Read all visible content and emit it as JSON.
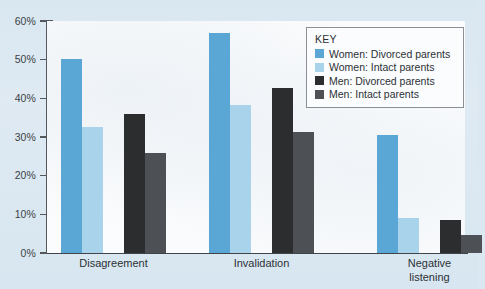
{
  "chart_data": {
    "type": "bar",
    "title": "",
    "xlabel": "",
    "ylabel": "",
    "ylim": [
      0,
      60
    ],
    "grid": false,
    "legend_position": "top-right",
    "y_ticks": [
      "0%",
      "10%",
      "20%",
      "30%",
      "40%",
      "50%",
      "60%"
    ],
    "y_tick_values": [
      0,
      10,
      20,
      30,
      40,
      50,
      60
    ],
    "categories": [
      "Disagreement",
      "Invalidation",
      "Negative\nlistening"
    ],
    "series": [
      {
        "name": "Women: Divorced parents",
        "color": "#5aa7d6",
        "values": [
          50.2,
          56.8,
          30.4
        ]
      },
      {
        "name": "Women: Intact parents",
        "color": "#a8d3ea",
        "values": [
          32.7,
          38.2,
          9.0
        ]
      },
      {
        "name": "Men: Divorced parents",
        "color": "#2c2d2f",
        "values": [
          36.0,
          42.6,
          8.5
        ]
      },
      {
        "name": "Men: Intact parents",
        "color": "#4d5054",
        "values": [
          25.9,
          31.2,
          4.6
        ]
      }
    ]
  },
  "legend": {
    "title": "KEY",
    "entries": [
      {
        "label": "Women: Divorced parents",
        "color": "#5aa7d6"
      },
      {
        "label": "Women: Intact parents",
        "color": "#a8d3ea"
      },
      {
        "label": "Men: Divorced parents",
        "color": "#2c2d2f"
      },
      {
        "label": "Men: Intact parents",
        "color": "#4d5054"
      }
    ]
  },
  "axis": {
    "y_labels": [
      "60%",
      "50%",
      "40%",
      "30%",
      "20%",
      "10%",
      "0%"
    ],
    "x_labels": [
      "Disagreement",
      "Invalidation",
      "Negative\nlistening"
    ]
  }
}
